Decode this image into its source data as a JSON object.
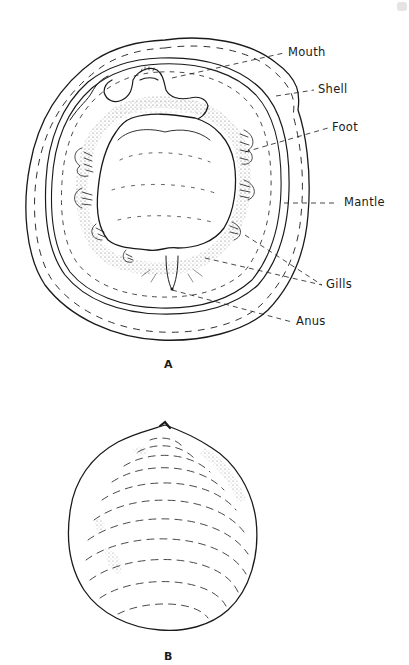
{
  "figure_a": {
    "caption": "A",
    "labels": {
      "mouth": "Mouth",
      "shell": "Shell",
      "foot": "Foot",
      "mantle": "Mantle",
      "gills": "Gills",
      "anus": "Anus"
    }
  },
  "figure_b": {
    "caption": "B"
  },
  "colors": {
    "ink": "#1a1a1a",
    "background": "#ffffff"
  }
}
